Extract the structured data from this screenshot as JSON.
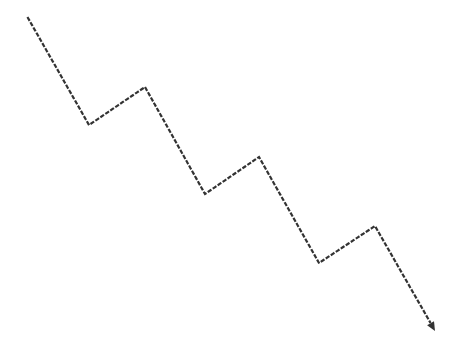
{
  "diagram": {
    "type": "dotted-zigzag-arrow",
    "direction": "downward-right",
    "stroke_color": "#333333",
    "background_color": "#ffffff",
    "dot_size": 2.2,
    "dot_gap": 3.8,
    "points": [
      [
        28,
        18
      ],
      [
        89,
        125
      ],
      [
        145,
        87
      ],
      [
        205,
        194
      ],
      [
        259,
        157
      ],
      [
        319,
        263
      ],
      [
        375,
        226
      ],
      [
        430,
        322
      ]
    ],
    "arrowhead": {
      "tip": [
        435,
        331
      ],
      "shape": "triangle"
    }
  }
}
